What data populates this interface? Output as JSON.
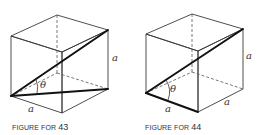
{
  "figures": [
    {
      "id": "43",
      "caption_prefix": "FIGURE FOR",
      "caption_number": "43",
      "labels": {
        "side_right": "a",
        "side_bottom": "a",
        "angle": "θ"
      }
    },
    {
      "id": "44",
      "caption_prefix": "FIGURE FOR",
      "caption_number": "44",
      "labels": {
        "side_right": "a",
        "side_bottom_left": "a",
        "side_bottom_right": "a",
        "angle": "θ"
      }
    }
  ],
  "colors": {
    "front_face": "#ececec",
    "right_face": "#d4d4d4",
    "top_face": "#ffffff"
  }
}
